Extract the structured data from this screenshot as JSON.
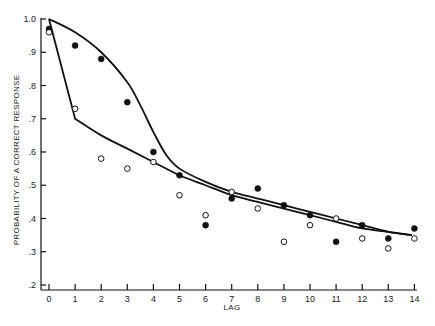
{
  "chart_data": {
    "type": "scatter",
    "title": "",
    "xlabel": "LAG",
    "ylabel": "PROBABILITY OF A CORRECT RESPONSE",
    "xlim": [
      0,
      14
    ],
    "ylim": [
      0.2,
      1.0
    ],
    "grid": false,
    "legend": null,
    "x_ticks": [
      "0",
      "1",
      "2",
      "3",
      "4",
      "5",
      "6",
      "7",
      "8",
      "9",
      "10",
      "11",
      "12",
      "13",
      "14"
    ],
    "y_ticks": [
      ".2",
      ".3",
      ".4",
      ".5",
      ".6",
      ".7",
      ".8",
      ".9",
      "1.0"
    ],
    "x": [
      0,
      1,
      2,
      3,
      4,
      5,
      6,
      7,
      8,
      9,
      10,
      11,
      12,
      13,
      14
    ],
    "series": [
      {
        "name": "filled circles",
        "marker": "filled-circle",
        "values": [
          0.97,
          0.92,
          0.88,
          0.75,
          0.6,
          0.53,
          0.38,
          0.46,
          0.49,
          0.44,
          0.41,
          0.33,
          0.38,
          0.34,
          0.37
        ]
      },
      {
        "name": "open circles",
        "marker": "open-circle",
        "values": [
          0.96,
          0.73,
          0.58,
          0.55,
          0.57,
          0.47,
          0.41,
          0.48,
          0.43,
          0.33,
          0.38,
          0.4,
          0.34,
          0.31,
          0.34
        ]
      },
      {
        "name": "upper fitted curve",
        "type": "line",
        "x": [
          0,
          1,
          2,
          3,
          3.5,
          4,
          4.5,
          5,
          6,
          7,
          8,
          9,
          10,
          11,
          12,
          13,
          13.9
        ],
        "values": [
          1.0,
          0.96,
          0.9,
          0.81,
          0.74,
          0.66,
          0.59,
          0.55,
          0.51,
          0.48,
          0.46,
          0.44,
          0.42,
          0.4,
          0.38,
          0.36,
          0.35
        ]
      },
      {
        "name": "lower fitted curve",
        "type": "line",
        "x": [
          0,
          1,
          2,
          3,
          4,
          5,
          6,
          7,
          8,
          9,
          10,
          11,
          12,
          13,
          13.9
        ],
        "values": [
          1.0,
          0.7,
          0.65,
          0.61,
          0.57,
          0.53,
          0.5,
          0.47,
          0.45,
          0.43,
          0.41,
          0.39,
          0.37,
          0.36,
          0.35
        ]
      }
    ]
  },
  "plot": {
    "origin_px": [
      49,
      285
    ],
    "x_step_px": 26.1,
    "y_per_unit_px": 332.5,
    "stroke_color": "#111111"
  }
}
